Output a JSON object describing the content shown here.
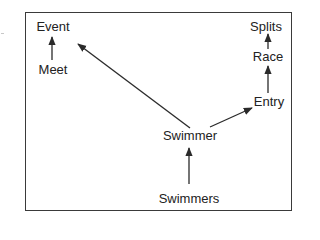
{
  "diagram": {
    "type": "hierarchy",
    "colors": {
      "border": "#3a3a3a",
      "edge": "#2a2a2a",
      "text": "#222222",
      "background": "#ffffff"
    },
    "nodes": {
      "event": {
        "label": "Event"
      },
      "meet": {
        "label": "Meet"
      },
      "splits": {
        "label": "Splits"
      },
      "race": {
        "label": "Race"
      },
      "entry": {
        "label": "Entry"
      },
      "swimmer": {
        "label": "Swimmer"
      },
      "swimmers": {
        "label": "Swimmers"
      }
    },
    "edges": [
      {
        "from": "Meet",
        "to": "Event"
      },
      {
        "from": "Swimmer",
        "to": "Event"
      },
      {
        "from": "Swimmer",
        "to": "Entry"
      },
      {
        "from": "Entry",
        "to": "Race"
      },
      {
        "from": "Race",
        "to": "Splits"
      },
      {
        "from": "Swimmers",
        "to": "Swimmer"
      }
    ]
  }
}
